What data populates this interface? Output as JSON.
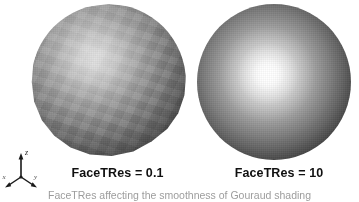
{
  "figure": {
    "caption": "FaceTRes affecting the smoothness of Gouraud shading",
    "background_color": "#ffffff"
  },
  "panels": [
    {
      "id": "left",
      "label": "FaceTRes = 0.1",
      "shading": "faceted",
      "description": "Coarsely tessellated sphere with visible polygonal facets and a dull diffuse highlight"
    },
    {
      "id": "right",
      "label": "FaceTRes = 10",
      "shading": "smooth",
      "description": "Finely tessellated sphere with smooth Gouraud shading and a bright specular highlight"
    }
  ],
  "axis_triad": {
    "name": "coordinate-axis-indicator",
    "axes": [
      {
        "name": "z",
        "label": "z",
        "direction": "up"
      },
      {
        "name": "x",
        "label": "x",
        "direction": "down-left"
      },
      {
        "name": "y",
        "label": "y",
        "direction": "down-right"
      }
    ]
  },
  "colors": {
    "sphere_highlight": "#ffffff",
    "sphere_midtone": "#9a9a9a",
    "sphere_shadow": "#0a0a0a",
    "label_text": "#101010",
    "caption_text": "#4a4a4a"
  }
}
